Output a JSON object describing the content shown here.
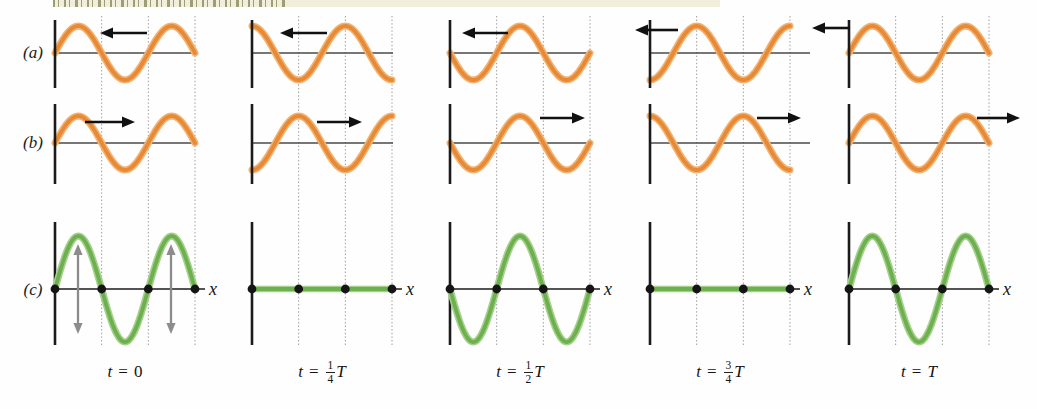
{
  "figure": {
    "width": 1037,
    "height": 409,
    "strip": {
      "x": 53,
      "y": 0,
      "w": 667,
      "h": 7,
      "bg": "#f1eedb",
      "speckle": "#8f8f66",
      "speckle_w": 232
    },
    "colors": {
      "orange_core": "#e68a38",
      "orange_halo": "#f3b26f",
      "green_core": "#6db04f",
      "green_halo": "#a5d08a",
      "axis": "#1b1b1b",
      "hline": "#4a4a4a",
      "grid": "#9a9a9a",
      "dot": "#151515",
      "black_arrow": "#111111",
      "gray_arrow": "#8c8c8c"
    },
    "layout": {
      "panel_xs": [
        55,
        252,
        450,
        650,
        849
      ],
      "panel_w": 140,
      "wavelength_px": 93.33,
      "grid_top": 16,
      "grid_bottom": 347,
      "row_a_y": 53,
      "row_b_y": 143,
      "row_c_y": 289,
      "amp_ab": 27,
      "amp_c": 53,
      "axis_a": [
        20,
        88
      ],
      "axis_b": [
        104,
        184
      ],
      "axis_c": [
        222,
        345
      ],
      "c_axis_len": 150,
      "dot_offsets": [
        0,
        46.7,
        93.3,
        140
      ],
      "dot_r": 4.4
    },
    "row_labels": [
      {
        "text": "(a)",
        "x": 16,
        "y": 44
      },
      {
        "text": "(b)",
        "x": 16,
        "y": 134
      },
      {
        "text": "(c)",
        "x": 16,
        "y": 281
      }
    ],
    "x_label": "x",
    "columns": [
      {
        "time": {
          "var": "t",
          "eq": "=",
          "num": "",
          "den": "",
          "suffix": "0",
          "suffix_italic": false
        },
        "a": {
          "shape": "sin",
          "arrow": {
            "dir": "left",
            "x1": 100,
            "x2": 147,
            "y": 33
          }
        },
        "b": {
          "shape": "sin",
          "arrow": {
            "dir": "right",
            "x1": 85,
            "x2": 135,
            "y": 122
          }
        },
        "c": {
          "shape": "sin2",
          "osc_arrows": [
            78,
            171
          ]
        }
      },
      {
        "time": {
          "var": "t",
          "eq": "=",
          "num": "1",
          "den": "4",
          "suffix": "T",
          "suffix_italic": true
        },
        "a": {
          "shape": "cos",
          "arrow": {
            "dir": "left",
            "x1": 280,
            "x2": 327,
            "y": 33
          }
        },
        "b": {
          "shape": "-cos",
          "arrow": {
            "dir": "right",
            "x1": 317,
            "x2": 362,
            "y": 122
          }
        },
        "c": {
          "shape": "flat",
          "osc_arrows": []
        }
      },
      {
        "time": {
          "var": "t",
          "eq": "=",
          "num": "1",
          "den": "2",
          "suffix": "T",
          "suffix_italic": true
        },
        "a": {
          "shape": "-sin",
          "arrow": {
            "dir": "left",
            "x1": 462,
            "x2": 508,
            "y": 33
          }
        },
        "b": {
          "shape": "-sin",
          "arrow": {
            "dir": "right",
            "x1": 540,
            "x2": 585,
            "y": 118
          }
        },
        "c": {
          "shape": "-sin2",
          "osc_arrows": []
        }
      },
      {
        "time": {
          "var": "t",
          "eq": "=",
          "num": "3",
          "den": "4",
          "suffix": "T",
          "suffix_italic": true
        },
        "a": {
          "shape": "-cos",
          "arrow": {
            "dir": "left",
            "x1": 635,
            "x2": 678,
            "y": 30
          }
        },
        "b": {
          "shape": "cos",
          "arrow": {
            "dir": "right",
            "x1": 757,
            "x2": 801,
            "y": 118
          }
        },
        "c": {
          "shape": "flat",
          "osc_arrows": []
        },
        "hline_ext": 160
      },
      {
        "time": {
          "var": "t",
          "eq": "=",
          "num": "",
          "den": "",
          "suffix": "T",
          "suffix_italic": true
        },
        "a": {
          "shape": "sin",
          "arrow": {
            "dir": "left",
            "x1": 812,
            "x2": 850,
            "y": 28
          }
        },
        "b": {
          "shape": "sin",
          "arrow": {
            "dir": "right",
            "x1": 977,
            "x2": 1020,
            "y": 118
          }
        },
        "c": {
          "shape": "sin2",
          "osc_arrows": []
        }
      }
    ]
  },
  "chart_data": {
    "type": "line",
    "subtype": "standing-wave-superposition-figure",
    "x_axis": {
      "label": "x",
      "span_wavelengths": 1.5,
      "gridlines_at_wavelengths": [
        0.5,
        1.0,
        1.5
      ]
    },
    "time_steps": [
      "0",
      "T/4",
      "T/2",
      "3T/4",
      "T"
    ],
    "rows": [
      {
        "id": "(a)",
        "description": "wave traveling left",
        "color_key": "orange",
        "amplitude": "A",
        "waveform_vs_time": [
          "sin(kx)",
          "cos(kx)",
          "-sin(kx)",
          "-cos(kx)",
          "sin(kx)"
        ]
      },
      {
        "id": "(b)",
        "description": "wave traveling right",
        "color_key": "orange",
        "amplitude": "A",
        "waveform_vs_time": [
          "sin(kx)",
          "-cos(kx)",
          "-sin(kx)",
          "cos(kx)",
          "sin(kx)"
        ]
      },
      {
        "id": "(c)",
        "description": "superposition: standing wave",
        "color_key": "green",
        "amplitude": "2A",
        "waveform_vs_time": [
          "2A sin(kx)",
          "0 (flat)",
          "-2A sin(kx)",
          "0 (flat)",
          "2A sin(kx)"
        ],
        "nodes_at_wavelengths": [
          0,
          0.5,
          1.0,
          1.5
        ],
        "antinode_oscillation_arrows_shown_at": "t = 0"
      }
    ]
  }
}
